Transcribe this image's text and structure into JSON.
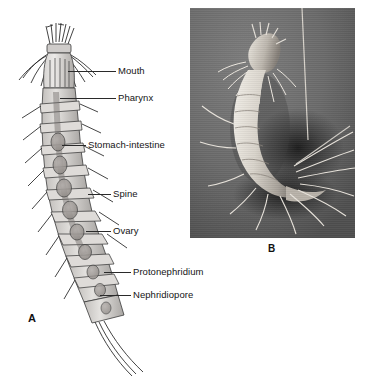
{
  "figure": {
    "background_color": "#ffffff",
    "panels": [
      {
        "id": "A",
        "label": "A",
        "type": "labeled-line-drawing",
        "subject": "segmented microscopic invertebrate, dorsal view"
      },
      {
        "id": "B",
        "label": "B",
        "type": "scanning-electron-micrograph",
        "background_color": "#6e6e6e",
        "subject": "whole specimen, lateral view with long terminal setae"
      }
    ]
  },
  "panel_a": {
    "label": "A",
    "callouts": [
      {
        "text": "Mouth",
        "label_x": 118,
        "label_y": 66,
        "leader_x": 68,
        "leader_y": 71,
        "leader_w": 48
      },
      {
        "text": "Pharynx",
        "label_x": 118,
        "label_y": 93,
        "leader_x": 60,
        "leader_y": 98,
        "leader_w": 56
      },
      {
        "text": "Stomach-intestine",
        "label_x": 88,
        "label_y": 140,
        "leader_x": 62,
        "leader_y": 145,
        "leader_w": 24
      },
      {
        "text": "Spine",
        "label_x": 113,
        "label_y": 189,
        "leader_x": 88,
        "leader_y": 194,
        "leader_w": 23
      },
      {
        "text": "Ovary",
        "label_x": 113,
        "label_y": 226,
        "leader_x": 86,
        "leader_y": 231,
        "leader_w": 25
      },
      {
        "text": "Protonephridium",
        "label_x": 133,
        "label_y": 267,
        "leader_x": 104,
        "leader_y": 272,
        "leader_w": 27
      },
      {
        "text": "Nephridiopore",
        "label_x": 133,
        "label_y": 290,
        "leader_x": 100,
        "leader_y": 295,
        "leader_w": 31
      }
    ]
  },
  "panel_b": {
    "label": "B",
    "frame": {
      "x": 190,
      "y": 8,
      "width": 165,
      "height": 230
    }
  }
}
